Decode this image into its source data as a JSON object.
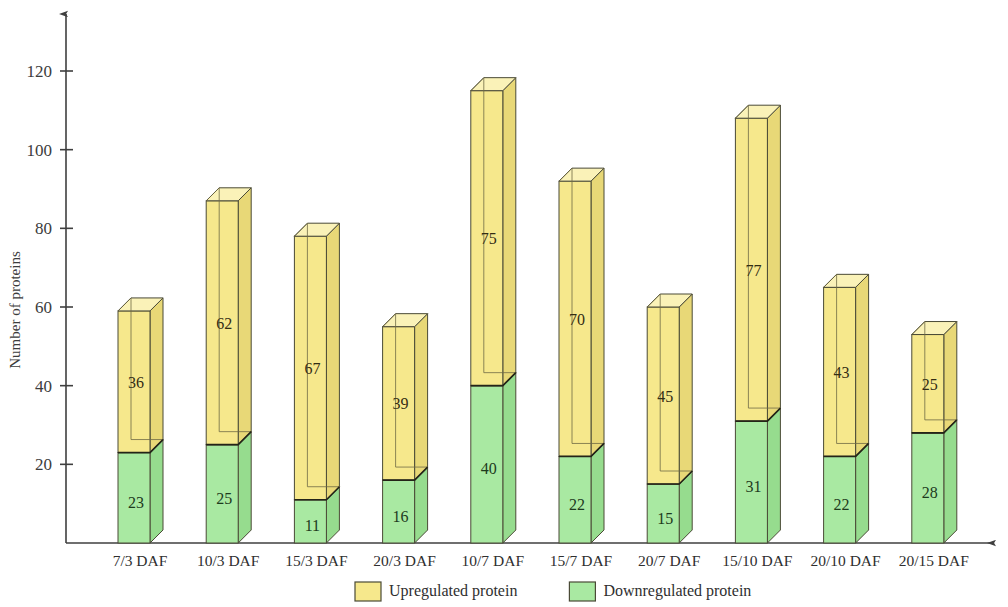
{
  "chart_data": {
    "type": "bar",
    "stacked": true,
    "title": "",
    "xlabel": "",
    "ylabel": "Number of proteins",
    "ylim": [
      0,
      130
    ],
    "yticks": [
      20,
      40,
      60,
      80,
      100,
      120
    ],
    "grid": false,
    "legend_position": "bottom",
    "categories": [
      "7/3 DAF",
      "10/3 DAF",
      "15/3 DAF",
      "20/3 DAF",
      "10/7 DAF",
      "15/7 DAF",
      "20/7 DAF",
      "15/10 DAF",
      "20/10 DAF",
      "20/15 DAF"
    ],
    "series": [
      {
        "name": "Downregulated protein",
        "color": "#A9E9A2",
        "values": [
          23,
          25,
          11,
          16,
          40,
          22,
          15,
          31,
          22,
          28
        ]
      },
      {
        "name": "Upregulated protein",
        "color": "#F6E88C",
        "values": [
          36,
          62,
          67,
          39,
          75,
          70,
          45,
          77,
          43,
          25
        ]
      }
    ],
    "totals": [
      59,
      87,
      78,
      55,
      115,
      92,
      60,
      108,
      65,
      53
    ]
  },
  "axes": {
    "y_title": "Number of proteins",
    "y_tick_labels": [
      "20",
      "40",
      "60",
      "80",
      "100",
      "120"
    ]
  },
  "legend": {
    "items": [
      {
        "label": "Upregulated protein",
        "color": "#F6E88C"
      },
      {
        "label": "Downregulated protein",
        "color": "#A9E9A2"
      }
    ]
  },
  "colors": {
    "upregulated_front": "#F6E88C",
    "upregulated_top": "#FAF2B8",
    "upregulated_side": "#E8D877",
    "downregulated_front": "#A9E9A2",
    "downregulated_top": "#CDF3C7",
    "downregulated_side": "#96DC8E",
    "axis": "#3f3f3f",
    "outline": "#4a4a36",
    "background": "#ffffff"
  }
}
